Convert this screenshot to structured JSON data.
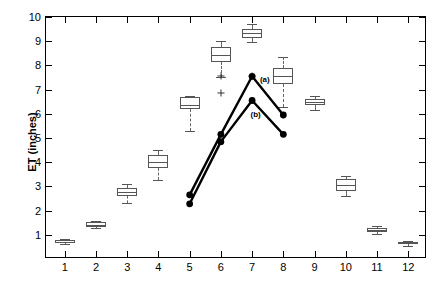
{
  "chart_data": {
    "type": "box",
    "title": "",
    "xlabel": "",
    "ylabel": "ET (inches)",
    "xlim": [
      0.4,
      12.6
    ],
    "ylim": [
      0,
      10
    ],
    "yticks": [
      1,
      2,
      3,
      4,
      5,
      6,
      7,
      8,
      9,
      10
    ],
    "xticks": [
      1,
      2,
      3,
      4,
      5,
      6,
      7,
      8,
      9,
      10,
      11,
      12
    ],
    "grid": false,
    "legend_position": "inline-annotation",
    "boxes": [
      {
        "x": 1,
        "whisker_low": 0.62,
        "q1": 0.65,
        "median": 0.72,
        "q3": 0.8,
        "whisker_high": 0.82
      },
      {
        "x": 2,
        "whisker_low": 1.3,
        "q1": 1.32,
        "median": 1.4,
        "q3": 1.52,
        "whisker_high": 1.55
      },
      {
        "x": 3,
        "whisker_low": 2.32,
        "q1": 2.62,
        "median": 2.78,
        "q3": 2.92,
        "whisker_high": 3.08
      },
      {
        "x": 4,
        "whisker_low": 3.25,
        "q1": 3.78,
        "median": 4.02,
        "q3": 4.3,
        "whisker_high": 4.5
      },
      {
        "x": 5,
        "whisker_low": 5.3,
        "q1": 6.2,
        "median": 6.38,
        "q3": 6.7,
        "whisker_high": 6.72
      },
      {
        "x": 6,
        "whisker_low": 7.52,
        "q1": 8.12,
        "median": 8.45,
        "q3": 8.78,
        "whisker_high": 9.0
      },
      {
        "x": 7,
        "whisker_low": 8.95,
        "q1": 9.15,
        "median": 9.32,
        "q3": 9.5,
        "whisker_high": 9.72
      },
      {
        "x": 8,
        "whisker_low": 6.3,
        "q1": 7.25,
        "median": 7.58,
        "q3": 7.88,
        "whisker_high": 8.35
      },
      {
        "x": 9,
        "whisker_low": 6.15,
        "q1": 6.35,
        "median": 6.48,
        "q3": 6.6,
        "whisker_high": 6.72
      },
      {
        "x": 10,
        "whisker_low": 2.6,
        "q1": 2.82,
        "median": 3.05,
        "q3": 3.32,
        "whisker_high": 3.45
      },
      {
        "x": 11,
        "whisker_low": 1.05,
        "q1": 1.1,
        "median": 1.18,
        "q3": 1.28,
        "whisker_high": 1.35
      },
      {
        "x": 12,
        "whisker_low": 0.55,
        "q1": 0.6,
        "median": 0.65,
        "q3": 0.72,
        "whisker_high": 0.75
      }
    ],
    "outliers": [
      {
        "x": 6,
        "y": 7.55
      },
      {
        "x": 7,
        "y": 7.55
      },
      {
        "x": 6,
        "y": 6.85
      }
    ],
    "series": [
      {
        "name": "(a)",
        "label": "(a)",
        "marker": "filled-circle",
        "color": "#000000",
        "x": [
          5,
          6,
          7,
          8
        ],
        "values": [
          2.65,
          5.15,
          7.55,
          5.95
        ],
        "label_x": 7.25,
        "label_y": 7.45
      },
      {
        "name": "(b)",
        "label": "(b)",
        "marker": "filled-circle",
        "color": "#000000",
        "x": [
          5,
          6,
          7,
          8
        ],
        "values": [
          2.28,
          4.85,
          6.55,
          5.15
        ],
        "label_x": 6.95,
        "label_y": 6.0
      }
    ]
  },
  "axis": {
    "y_title": "ET (inches)",
    "y_tick_labels": [
      "1",
      "2",
      "3",
      "4",
      "5",
      "6",
      "7",
      "8",
      "9",
      "10"
    ],
    "x_tick_labels": [
      "1",
      "2",
      "3",
      "4",
      "5",
      "6",
      "7",
      "8",
      "9",
      "10",
      "11",
      "12"
    ]
  }
}
